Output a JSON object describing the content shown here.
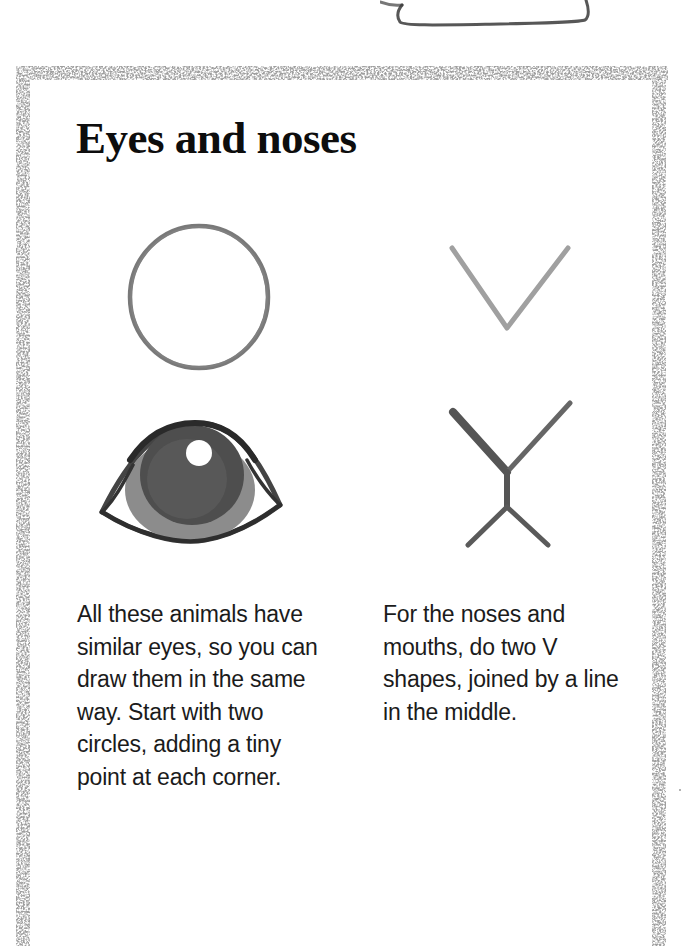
{
  "page": {
    "title": "Eyes and noses",
    "frame_color": "#6e6e6e",
    "ink_color": "#1a1a1a"
  },
  "illustrations": {
    "eye_steps": [
      {
        "step": 1,
        "label": "circle-outline"
      },
      {
        "step": 2,
        "label": "finished-eye"
      }
    ],
    "nose_steps": [
      {
        "step": 1,
        "label": "v-shape"
      },
      {
        "step": 2,
        "label": "two-v-shapes-joined"
      }
    ]
  },
  "captions": {
    "left": {
      "lines": [
        "All these animals have",
        "similar eyes, so you can",
        "draw them in the same",
        "way. Start with two",
        "circles, adding a tiny",
        "point at each corner."
      ]
    },
    "right": {
      "lines": [
        "For the noses and",
        "mouths, do two V",
        "shapes, joined by a line",
        "in the middle."
      ]
    }
  }
}
